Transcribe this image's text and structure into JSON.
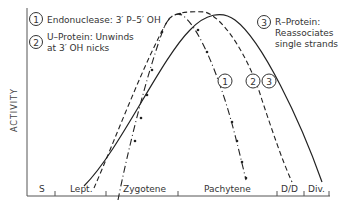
{
  "diagram": {
    "y_axis_label": "ACTIVITY",
    "legend": [
      {
        "number": "1",
        "text_line1": "Endonuclease: 3′ P–5′ OH",
        "text_line2": ""
      },
      {
        "number": "2",
        "text_line1": "U–Protein: Unwinds",
        "text_line2": "at 3′ OH nicks"
      },
      {
        "number": "3",
        "text_line1": "R–Protein:",
        "text_line2": "Reassociates",
        "text_line3": "single strands"
      }
    ],
    "curve_labels": [
      "1",
      "2",
      "3"
    ],
    "stages": [
      {
        "label": "S"
      },
      {
        "label": "Lept."
      },
      {
        "label": "Zygotene"
      },
      {
        "label": "Pachytene"
      },
      {
        "label": "D/D"
      },
      {
        "label": "Div."
      }
    ],
    "line_styles": {
      "1": "dash-dot with dots",
      "2": "dashed",
      "3": "solid"
    },
    "line_color": "#222222"
  }
}
